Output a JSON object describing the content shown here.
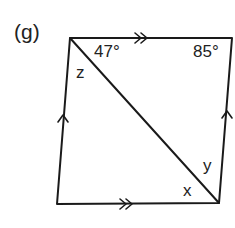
{
  "part_label": "(g)",
  "figure": {
    "shape": "parallelogram",
    "vertices": {
      "top_left": [
        70,
        38
      ],
      "top_right": [
        232,
        38
      ],
      "bottom_right": [
        219,
        203
      ],
      "bottom_left": [
        57,
        204
      ]
    },
    "diagonal": "top_left to bottom_right",
    "parallel_marks": {
      "top": "double arrow",
      "bottom": "double arrow",
      "left": "single arrow",
      "right": "single arrow"
    },
    "stroke_color": "#1a1a1a"
  },
  "angles": {
    "top_left_upper": "47°",
    "top_right": "85°"
  },
  "variables": {
    "z": "z",
    "y": "y",
    "x": "x"
  }
}
